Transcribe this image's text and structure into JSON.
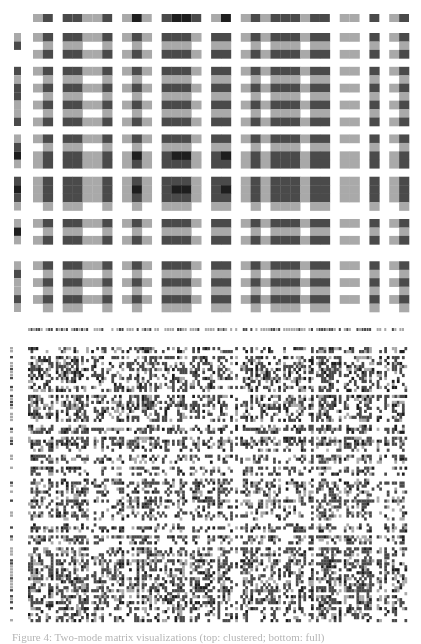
{
  "caption": "Figure 4: Two-mode matrix visualizations (top: clustered; bottom: full)",
  "colors": {
    "empty": "#ffffff",
    "light": "#a9a9a9",
    "dark": "#4a4a4a",
    "darkest": "#1e1e1e"
  },
  "chart_data": [
    {
      "type": "heatmap",
      "title": "Top matrix (block structure)",
      "levels": [
        "empty",
        "light",
        "dark",
        "darkest"
      ],
      "column_marginal": [
        1,
        2,
        0,
        2,
        2,
        1,
        1,
        2,
        0,
        1,
        3,
        1,
        0,
        2,
        3,
        3,
        2,
        0,
        1,
        3,
        0,
        1,
        2,
        1,
        2,
        2,
        2,
        1,
        2,
        2,
        0,
        1,
        1,
        0,
        2,
        0,
        1,
        2
      ],
      "column_type": [
        1,
        2,
        0,
        2,
        2,
        1,
        1,
        2,
        0,
        1,
        2,
        1,
        0,
        2,
        2,
        2,
        1,
        0,
        2,
        2,
        0,
        1,
        2,
        1,
        2,
        2,
        2,
        1,
        2,
        2,
        0,
        1,
        1,
        0,
        2,
        0,
        1,
        2
      ],
      "row_marginal": [
        1,
        2,
        0,
        0,
        2,
        1,
        2,
        2,
        1,
        1,
        2,
        0,
        1,
        2,
        3,
        1,
        0,
        2,
        3,
        2,
        1,
        0,
        1,
        3,
        1,
        0,
        0,
        1,
        2,
        1,
        1,
        2,
        1
      ],
      "row_type": [
        2,
        1,
        2,
        0,
        2,
        1,
        2,
        1,
        2,
        1,
        2,
        0,
        2,
        1,
        2,
        2,
        0,
        2,
        2,
        2,
        1,
        0,
        2,
        1,
        2,
        0,
        0,
        2,
        1,
        2,
        1,
        2,
        1
      ]
    },
    {
      "type": "heatmap",
      "title": "Bottom matrix (dense)",
      "n_rows": 92,
      "n_cols": 150,
      "density": 0.55,
      "levels": [
        "empty",
        "light",
        "dark",
        "darkest"
      ]
    }
  ]
}
